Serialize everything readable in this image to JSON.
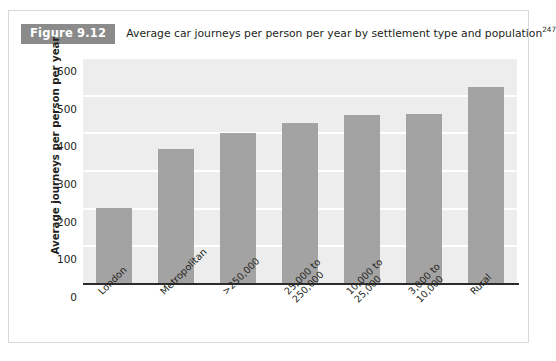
{
  "figure": {
    "tag": "Figure 9.12",
    "caption": "Average car journeys per person per year by settlement type and population",
    "caption_superscript": "247",
    "tag_bg_color": "#8b8b8b",
    "tag_text_color": "#ffffff"
  },
  "chart_data": {
    "type": "bar",
    "title": "Average car journeys per person per year by settlement type and population",
    "xlabel": "",
    "ylabel": "Average journeys per person per year",
    "categories": [
      "London",
      "Metropolitan",
      ">250,000",
      "25,000 to 250,000",
      "10,000 to 25,000",
      "3,000 to 10,000",
      "Rural"
    ],
    "category_lines": [
      [
        "London"
      ],
      [
        "Metropolitan"
      ],
      [
        ">250,000"
      ],
      [
        "25,000 to",
        "250,000"
      ],
      [
        "10,000 to",
        "25,000"
      ],
      [
        "3,000 to",
        "10,000"
      ],
      [
        "Rural"
      ]
    ],
    "values": [
      200,
      355,
      398,
      425,
      445,
      448,
      520
    ],
    "ylim": [
      0,
      600
    ],
    "yticks": [
      0,
      100,
      200,
      300,
      400,
      500,
      600
    ],
    "ytick_labels": [
      "0",
      "100",
      "200",
      "300",
      "400",
      "500",
      "600"
    ],
    "grid": true,
    "grid_color": "#ffffff",
    "plot_bg_color": "#ededed",
    "bar_color": "#a3a3a3",
    "axis_color": "#2b2b2b",
    "legend": "none"
  }
}
